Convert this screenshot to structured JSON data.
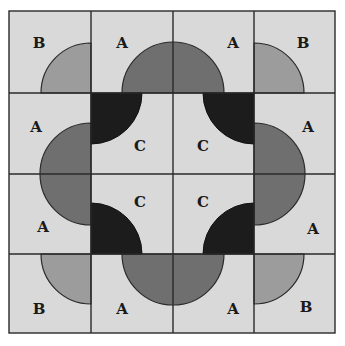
{
  "diagram": {
    "colors": {
      "background": "#d9d9d9",
      "grid_line": "#2a2a2a",
      "shape_A": "#6f6f6f",
      "shape_B": "#9c9c9c",
      "shape_C": "#1c1c1c"
    },
    "grid": {
      "rows": 4,
      "cols": 4,
      "x_lines": [
        9,
        91,
        173,
        254,
        335
      ],
      "y_lines": [
        11,
        93,
        174,
        254,
        333
      ]
    },
    "tiles": [
      {
        "row": 0,
        "col": 0,
        "label": "B"
      },
      {
        "row": 0,
        "col": 1,
        "label": "A"
      },
      {
        "row": 0,
        "col": 2,
        "label": "A"
      },
      {
        "row": 0,
        "col": 3,
        "label": "B"
      },
      {
        "row": 1,
        "col": 0,
        "label": "A"
      },
      {
        "row": 1,
        "col": 1,
        "label": "C"
      },
      {
        "row": 1,
        "col": 2,
        "label": "C"
      },
      {
        "row": 1,
        "col": 3,
        "label": "A"
      },
      {
        "row": 2,
        "col": 0,
        "label": "A"
      },
      {
        "row": 2,
        "col": 1,
        "label": "C"
      },
      {
        "row": 2,
        "col": 2,
        "label": "C"
      },
      {
        "row": 2,
        "col": 3,
        "label": "A"
      },
      {
        "row": 3,
        "col": 0,
        "label": "B"
      },
      {
        "row": 3,
        "col": 1,
        "label": "A"
      },
      {
        "row": 3,
        "col": 2,
        "label": "A"
      },
      {
        "row": 3,
        "col": 3,
        "label": "B"
      }
    ]
  }
}
